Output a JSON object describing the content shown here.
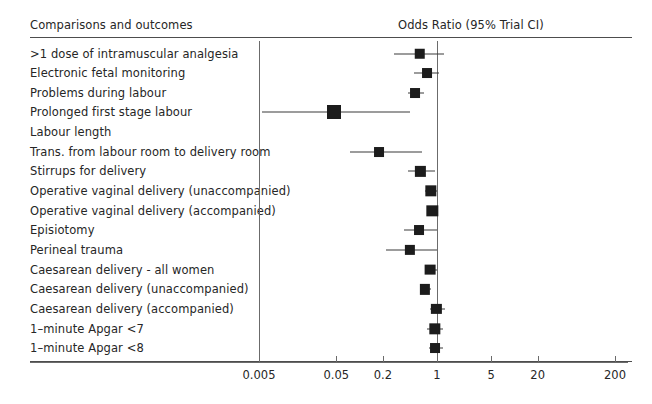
{
  "header": {
    "left_title": "Comparisons and outcomes",
    "right_title": "Odds Ratio (95%  Trial CI)"
  },
  "chart_data": {
    "type": "scatter",
    "plot_kind": "forest-plot",
    "title": "Odds Ratio (95%  Trial CI)",
    "xlabel": "",
    "ylabel": "Comparisons and outcomes",
    "xscale": "log",
    "grid": false,
    "legend": "none",
    "xlim": [
      0.0015,
      600
    ],
    "xticks": [
      0.005,
      0.05,
      0.2,
      1,
      5,
      20,
      200
    ],
    "xticklabels": [
      "0.005",
      "0.05",
      "0.2",
      "1",
      "5",
      "20",
      "200"
    ],
    "reference_lines": [
      0.005,
      1
    ],
    "categories": [
      ">1 dose of intramuscular analgesia",
      "Electronic fetal monitoring",
      "Problems during labour",
      "Prolonged first stage labour",
      "Labour length",
      "Trans. from labour room to delivery room",
      "Stirrups for delivery",
      "Operative vaginal delivery (unaccompanied)",
      "Operative vaginal delivery (accompanied)",
      "Episiotomy",
      "Perineal trauma",
      "Caesarean delivery - all women",
      "Caesarean delivery (unaccompanied)",
      "Caesarean delivery (accompanied)",
      "1–minute Apgar <7",
      "1–minute Apgar <8"
    ],
    "points": [
      {
        "label": ">1 dose of intramuscular analgesia",
        "odds_ratio": 0.6,
        "ci_low": 0.28,
        "ci_high": 1.25,
        "weight": 0.5,
        "has_marker": true
      },
      {
        "label": "Electronic fetal monitoring",
        "odds_ratio": 0.74,
        "ci_low": 0.5,
        "ci_high": 1.05,
        "weight": 0.42,
        "has_marker": true
      },
      {
        "label": "Problems during labour",
        "odds_ratio": 0.52,
        "ci_low": 0.42,
        "ci_high": 0.68,
        "weight": 0.42,
        "has_marker": true
      },
      {
        "label": "Prolonged first stage labour",
        "odds_ratio": 0.046,
        "ci_low": 0.0055,
        "ci_high": 0.45,
        "weight": 1.0,
        "has_marker": true
      },
      {
        "label": "Labour length",
        "odds_ratio": null,
        "ci_low": null,
        "ci_high": null,
        "weight": 0,
        "has_marker": false
      },
      {
        "label": "Trans. from labour room to delivery room",
        "odds_ratio": 0.18,
        "ci_low": 0.075,
        "ci_high": 0.64,
        "weight": 0.42,
        "has_marker": true
      },
      {
        "label": "Stirrups for delivery",
        "odds_ratio": 0.61,
        "ci_low": 0.42,
        "ci_high": 0.95,
        "weight": 0.46,
        "has_marker": true
      },
      {
        "label": "Operative vaginal delivery (unaccompanied)",
        "odds_ratio": 0.83,
        "ci_low": 0.7,
        "ci_high": 0.99,
        "weight": 0.62,
        "has_marker": true
      },
      {
        "label": "Operative vaginal delivery (accompanied)",
        "odds_ratio": 0.87,
        "ci_low": 0.74,
        "ci_high": 1.02,
        "weight": 0.62,
        "has_marker": true
      },
      {
        "label": "Episiotomy",
        "odds_ratio": 0.58,
        "ci_low": 0.38,
        "ci_high": 1.0,
        "weight": 0.42,
        "has_marker": true
      },
      {
        "label": "Perineal trauma",
        "odds_ratio": 0.45,
        "ci_low": 0.22,
        "ci_high": 1.0,
        "weight": 0.46,
        "has_marker": true
      },
      {
        "label": "Caesarean delivery - all women",
        "odds_ratio": 0.81,
        "ci_low": 0.7,
        "ci_high": 1.0,
        "weight": 0.54,
        "has_marker": true
      },
      {
        "label": "Caesarean delivery (unaccompanied)",
        "odds_ratio": 0.7,
        "ci_low": 0.6,
        "ci_high": 0.84,
        "weight": 0.46,
        "has_marker": true
      },
      {
        "label": "Caesarean delivery (accompanied)",
        "odds_ratio": 0.98,
        "ci_low": 0.8,
        "ci_high": 1.28,
        "weight": 0.46,
        "has_marker": true
      },
      {
        "label": "1–minute Apgar <7",
        "odds_ratio": 0.93,
        "ci_low": 0.74,
        "ci_high": 1.18,
        "weight": 0.62,
        "has_marker": true
      },
      {
        "label": "1–minute Apgar <8",
        "odds_ratio": 0.95,
        "ci_low": 0.78,
        "ci_high": 1.2,
        "weight": 0.42,
        "has_marker": true
      }
    ]
  },
  "colors": {
    "marker": "#1c1c1c",
    "line": "#3a3a3a",
    "axis": "#6b6b6b",
    "rule": "#4d4d4d",
    "text": "#262626",
    "background": "#ffffff"
  }
}
